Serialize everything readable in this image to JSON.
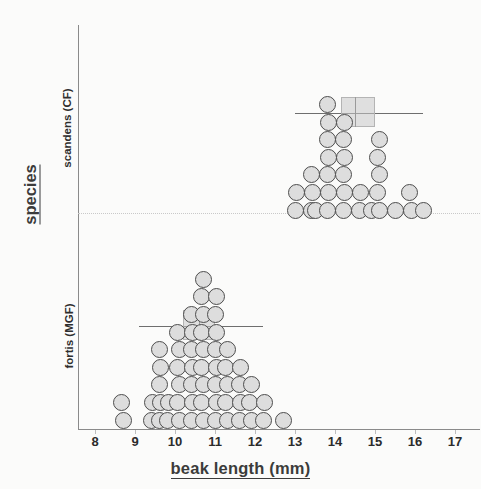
{
  "figure": {
    "x_axis": {
      "label": "beak length (mm)",
      "ticks": [
        8,
        9,
        10,
        11,
        12,
        13,
        14,
        15,
        16,
        17
      ],
      "min": 8,
      "max": 17
    },
    "y_axis": {
      "label": "species",
      "categories": [
        "scandens (CF)",
        "fortis (MGF)"
      ]
    },
    "colors": {
      "dot_fill": "#dddddd",
      "dot_stroke": "#4d4d4d",
      "box_fill": "#c8c8c8",
      "axis": "#8a8a8a",
      "text": "#2e2e2e"
    }
  },
  "chart_data": {
    "type": "scatter",
    "title": "",
    "xlabel": "beak length (mm)",
    "ylabel": "species",
    "xlim": [
      8,
      17
    ],
    "grid": false,
    "legend": "none",
    "plot_style": "dot-histogram (beeswarm) with boxplot overlay",
    "series": [
      {
        "name": "scandens (CF)",
        "dot_diameter_mm": 0.21,
        "boxplot": {
          "q1": 14.15,
          "median": 14.5,
          "q3": 15.0,
          "whisker_low": 13.0,
          "whisker_high": 16.2
        },
        "stacks": [
          {
            "x": 13.0,
            "count": 2
          },
          {
            "x": 13.4,
            "count": 3
          },
          {
            "x": 13.5,
            "count": 1
          },
          {
            "x": 13.8,
            "count": 7
          },
          {
            "x": 14.2,
            "count": 6
          },
          {
            "x": 14.6,
            "count": 2
          },
          {
            "x": 14.9,
            "count": 1
          },
          {
            "x": 15.1,
            "count": 5
          },
          {
            "x": 15.5,
            "count": 1
          },
          {
            "x": 15.9,
            "count": 2
          },
          {
            "x": 16.2,
            "count": 1
          }
        ],
        "points": [
          13.0,
          13.0,
          13.4,
          13.4,
          13.4,
          13.5,
          13.8,
          13.8,
          13.8,
          13.8,
          13.8,
          13.8,
          13.8,
          14.2,
          14.2,
          14.2,
          14.2,
          14.2,
          14.2,
          14.6,
          14.6,
          14.9,
          15.1,
          15.1,
          15.1,
          15.1,
          15.1,
          15.5,
          15.9,
          15.9,
          16.2
        ],
        "n": 31
      },
      {
        "name": "fortis (MGF)",
        "dot_diameter_mm": 0.21,
        "boxplot": {
          "q1": 10.2,
          "median": 10.6,
          "q3": 11.0,
          "whisker_low": 9.1,
          "whisker_high": 12.2
        },
        "stacks": [
          {
            "x": 8.7,
            "count": 2
          },
          {
            "x": 9.4,
            "count": 2
          },
          {
            "x": 9.6,
            "count": 5
          },
          {
            "x": 9.8,
            "count": 2
          },
          {
            "x": 10.1,
            "count": 6
          },
          {
            "x": 10.4,
            "count": 7
          },
          {
            "x": 10.7,
            "count": 9
          },
          {
            "x": 11.0,
            "count": 8
          },
          {
            "x": 11.3,
            "count": 5
          },
          {
            "x": 11.6,
            "count": 4
          },
          {
            "x": 11.9,
            "count": 3
          },
          {
            "x": 12.2,
            "count": 2
          },
          {
            "x": 12.7,
            "count": 1
          }
        ],
        "points": [
          8.7,
          8.7,
          9.4,
          9.4,
          9.6,
          9.6,
          9.6,
          9.6,
          9.6,
          9.8,
          9.8,
          10.1,
          10.1,
          10.1,
          10.1,
          10.1,
          10.1,
          10.4,
          10.4,
          10.4,
          10.4,
          10.4,
          10.4,
          10.4,
          10.7,
          10.7,
          10.7,
          10.7,
          10.7,
          10.7,
          10.7,
          10.7,
          10.7,
          11.0,
          11.0,
          11.0,
          11.0,
          11.0,
          11.0,
          11.0,
          11.0,
          11.3,
          11.3,
          11.3,
          11.3,
          11.3,
          11.6,
          11.6,
          11.6,
          11.6,
          11.9,
          11.9,
          11.9,
          12.2,
          12.2,
          12.7
        ],
        "n": 56
      }
    ]
  }
}
